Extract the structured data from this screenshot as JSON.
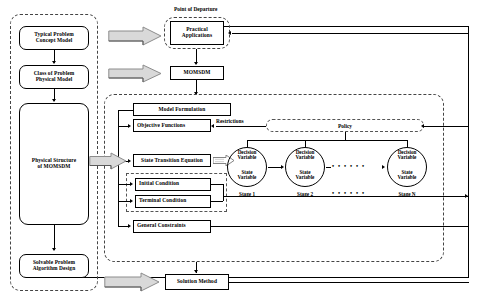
{
  "diagram": {
    "left_column": {
      "region_name": "theoretical-abstraction-region",
      "nodes": [
        {
          "id": "typical-problem-concept-model",
          "label": "Typical Problem\nConcept Model"
        },
        {
          "id": "class-of-problem-physical-model",
          "label": "Class of Problem\nPhysical Model"
        },
        {
          "id": "physical-structure-of-momsdm",
          "label": "Physical Structure\nof MOMSDM"
        },
        {
          "id": "solvable-problem-algorithm-design",
          "label": "Solvable Problem\nAlgorithm Design"
        }
      ]
    },
    "top": {
      "point_of_departure_label": "Point of Departure",
      "practical_applications": "Practical\nApplications",
      "momsdm": "MOMSDM"
    },
    "model": {
      "model_formulation": "Model Formulation",
      "objective_functions": "Objective Functions",
      "restrictions_label": "Restrictions",
      "policy": "Policy",
      "state_transition_equation": "State Transition Equation",
      "initial_condition": "Initial Condition",
      "terminal_condition": "Terminal Condition",
      "general_constraints": "General Constraints"
    },
    "stages": {
      "decision_variable_label": "Decision\nVariable",
      "state_variable_label": "State\nVariable",
      "ellipsis": "• • • • • •",
      "items": [
        {
          "id": "stage-1",
          "caption": "Stage 1"
        },
        {
          "id": "stage-2",
          "caption": "Stage 2"
        },
        {
          "id": "stage-n",
          "caption": "Stage N"
        }
      ]
    },
    "bottom": {
      "solution_method": "Solution Method"
    },
    "colors": {
      "line": "#000000",
      "block_arrow_fill": "#d9d9d9",
      "block_arrow_stroke": "#808080",
      "dash_region": "#444444",
      "background": "#ffffff"
    }
  }
}
